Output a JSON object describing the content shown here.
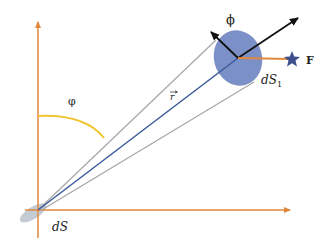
{
  "diagram": {
    "labels": {
      "phi_angle": "φ",
      "phi_vector": "ϕ",
      "r_vector": "r",
      "force": "F",
      "ds_source": "dS",
      "ds1_main": "dS",
      "ds1_sub": "1"
    },
    "colors": {
      "axis": "#e0883c",
      "arc": "#f2c430",
      "r_line": "#3a5a9a",
      "cone": "#a8a8a8",
      "target_ellipse": "#6e84c2",
      "source_ellipse": "#b9c2cc",
      "arrows": "#111111",
      "star": "#3b4f8c"
    }
  }
}
